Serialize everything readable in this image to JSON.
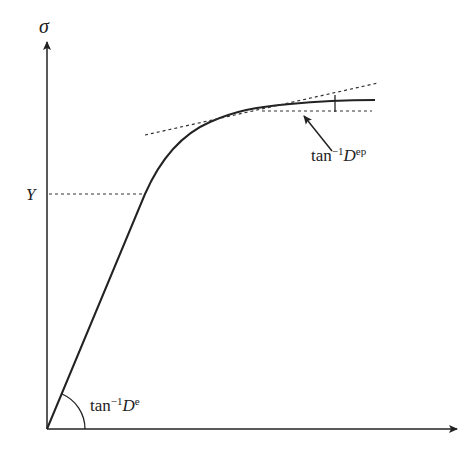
{
  "diagram": {
    "type": "stress-strain elastoplastic curve",
    "axes": {
      "y_label": "σ",
      "x_label": ""
    },
    "yield_label": "Y",
    "elastic_angle_label": {
      "prefix": "tan",
      "exponent": "−1",
      "symbol": "D",
      "superscript": "e"
    },
    "elastoplastic_angle_label": {
      "prefix": "tan",
      "exponent": "−1",
      "symbol": "D",
      "superscript": "ep"
    },
    "colors": {
      "line": "#222222",
      "dashed": "#333333",
      "background": "#ffffff"
    }
  }
}
